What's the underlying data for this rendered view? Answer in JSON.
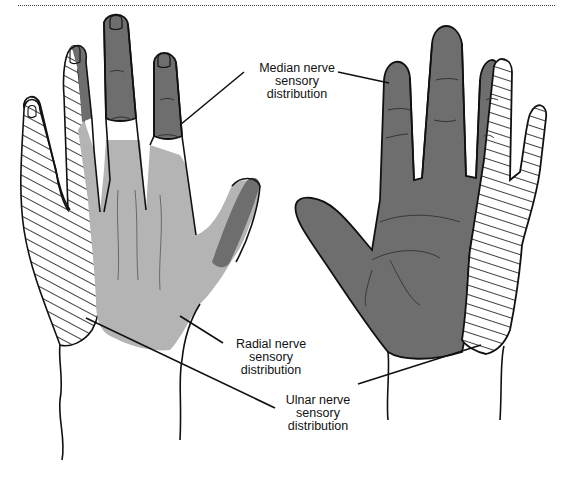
{
  "diagram": {
    "views": [
      {
        "name": "dorsal",
        "description": "Back of left hand"
      },
      {
        "name": "palmar",
        "description": "Palm of right hand"
      }
    ],
    "labels": {
      "median": {
        "line1": "Median nerve",
        "line2": "sensory",
        "line3": "distribution"
      },
      "radial": {
        "line1": "Radial nerve",
        "line2": "sensory",
        "line3": "distribution"
      },
      "ulnar": {
        "line1": "Ulnar nerve",
        "line2": "sensory",
        "line3": "distribution"
      }
    },
    "legend_fills": {
      "median": {
        "pattern": "dark solid",
        "color": "#6e6e6e"
      },
      "radial": {
        "pattern": "light solid",
        "color": "#b4b4b4"
      },
      "ulnar": {
        "pattern": "diagonal hatch",
        "color": "#ffffff"
      }
    }
  }
}
